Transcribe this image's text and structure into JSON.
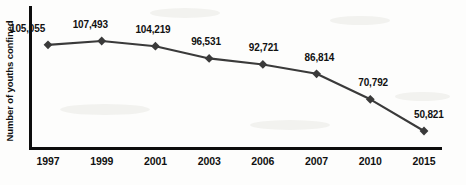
{
  "chart_data": {
    "type": "line",
    "title": "",
    "subtitle": "",
    "xlabel": "",
    "ylabel": "Number of youths confined",
    "grid": false,
    "legend": false,
    "legend_position": "none",
    "marker": "diamond",
    "line_color": "#3a3a3a",
    "marker_color": "#3a3a3a",
    "axis_color": "#0d0d0d",
    "background_color": "#fdfdfc",
    "categories": [
      "1997",
      "1999",
      "2001",
      "2003",
      "2006",
      "2007",
      "2010",
      "2015"
    ],
    "values": [
      105055,
      107493,
      104219,
      96531,
      92721,
      86814,
      70792,
      50821
    ],
    "value_labels": [
      "105,055",
      "107,493",
      "104,219",
      "96,531",
      "92,721",
      "86,814",
      "70,792",
      "50,821"
    ],
    "ylim": [
      0,
      120000
    ],
    "y_ticks_visible": false,
    "points": [
      {
        "x": "1997",
        "value": 105055,
        "label": "105,055"
      },
      {
        "x": "1999",
        "value": 107493,
        "label": "107,493"
      },
      {
        "x": "2001",
        "value": 104219,
        "label": "104,219"
      },
      {
        "x": "2003",
        "value": 96531,
        "label": "96,531"
      },
      {
        "x": "2006",
        "value": 92721,
        "label": "92,721"
      },
      {
        "x": "2007",
        "value": 86814,
        "label": "86,814"
      },
      {
        "x": "2010",
        "value": 70792,
        "label": "70,792"
      },
      {
        "x": "2015",
        "value": 50821,
        "label": "50,821"
      }
    ]
  }
}
